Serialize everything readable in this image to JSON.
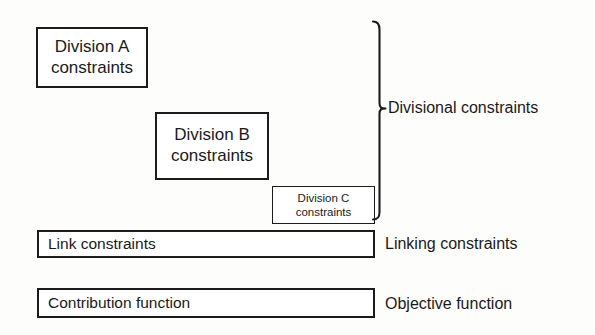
{
  "diagram": {
    "boxes": {
      "division_a": {
        "label": "Division A\nconstraints"
      },
      "division_b": {
        "label": "Division B\nconstraints"
      },
      "division_c": {
        "label": "Division C\nconstraints"
      },
      "link": {
        "label": "Link constraints"
      },
      "contribution": {
        "label": "Contribution function"
      }
    },
    "side_labels": {
      "divisional": "Divisional constraints",
      "linking": "Linking constraints",
      "objective": "Objective function"
    },
    "colors": {
      "background": "#fdfdfc",
      "stroke": "#1c1c1c",
      "box_fill": "#ffffff",
      "text": "#1a1a1a"
    }
  }
}
